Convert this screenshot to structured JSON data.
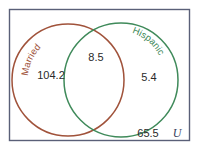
{
  "diagram": {
    "type": "venn",
    "universe": {
      "label": "U",
      "outside_value": "65.5"
    },
    "sets": [
      {
        "name": "Married",
        "only_value": "104.2",
        "color": "#a0523a"
      },
      {
        "name": "Hispanic",
        "only_value": "5.4",
        "color": "#3f8a5a"
      }
    ],
    "intersection_value": "8.5",
    "border_color": "#5a6078"
  }
}
